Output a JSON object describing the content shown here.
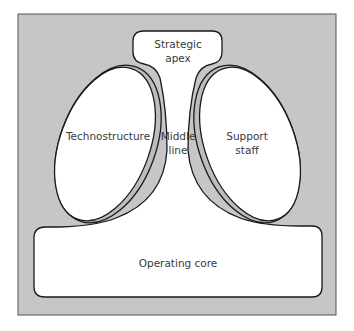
{
  "diagram": {
    "title": "",
    "colors": {
      "background": "#ffffff",
      "panel_fill": "#c6c6c6",
      "panel_border": "#555555",
      "shape_fill": "#ffffff",
      "shape_stroke": "#1a1a1a",
      "band_fill": "#bdbdbd",
      "text": "#3a3a3a"
    },
    "parts": {
      "strategic_apex": {
        "line1": "Strategic",
        "line2": "apex"
      },
      "technostructure": {
        "label": "Technostructure"
      },
      "middle_line": {
        "line1": "Middle",
        "line2": "line"
      },
      "support_staff": {
        "line1": "Support",
        "line2": "staff"
      },
      "operating_core": {
        "label": "Operating core"
      }
    }
  }
}
